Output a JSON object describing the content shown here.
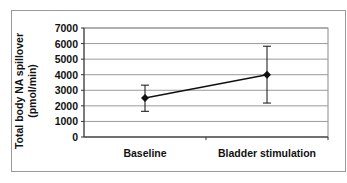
{
  "chart_data": {
    "type": "line",
    "title": "",
    "xlabel": "",
    "ylabel": "Total body NA spillover (pmol/min)",
    "ylabel_lines": [
      "Total body NA spillover",
      "(pmol/min)"
    ],
    "categories": [
      "Baseline",
      "Bladder stimulation"
    ],
    "series": [
      {
        "name": "Total body NA spillover",
        "values": [
          2500,
          4000
        ],
        "error_upper": [
          3330,
          5830
        ],
        "error_lower": [
          1650,
          2180
        ]
      }
    ],
    "ylim": [
      0,
      7000
    ],
    "yticks": [
      0,
      1000,
      2000,
      3000,
      4000,
      5000,
      6000,
      7000
    ],
    "grid": true,
    "legend": "none"
  }
}
